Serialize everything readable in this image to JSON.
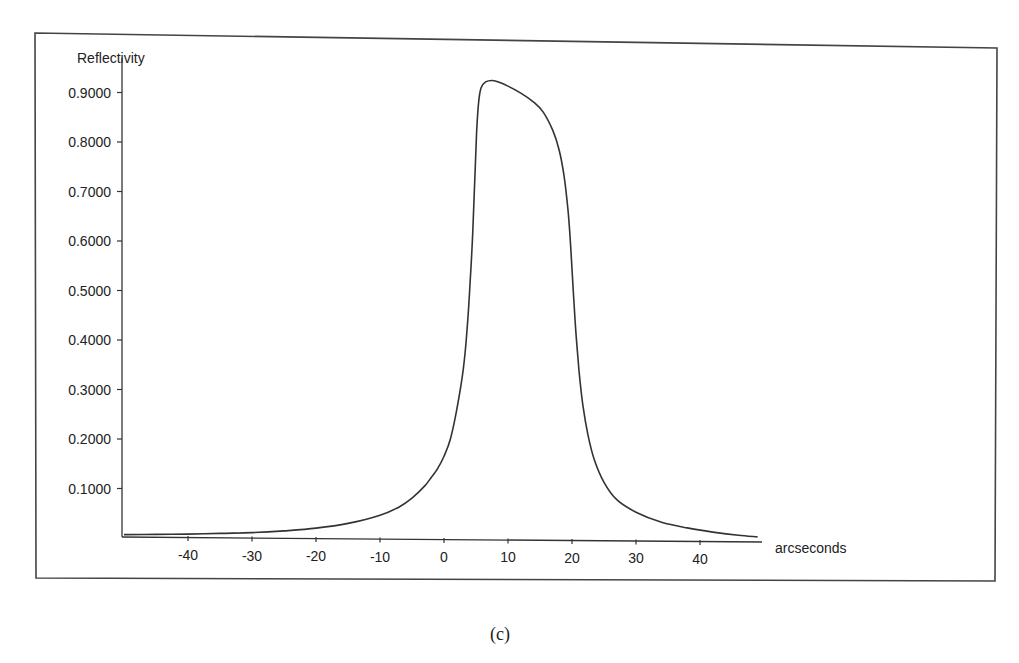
{
  "figure": {
    "caption": "(c)"
  },
  "chart_data": {
    "type": "line",
    "title": "",
    "xlabel": "arcseconds",
    "ylabel": "Reflectivity",
    "xlim": [
      -50,
      49
    ],
    "ylim": [
      0,
      0.95
    ],
    "grid": false,
    "legend": null,
    "x_ticks": [
      -40,
      -30,
      -20,
      -10,
      0,
      10,
      20,
      30,
      40
    ],
    "x_tick_labels": [
      "-40",
      "-30",
      "-20",
      "-10",
      "0",
      "10",
      "20",
      "30",
      "40"
    ],
    "y_ticks": [
      0.1,
      0.2,
      0.3,
      0.4,
      0.5,
      0.6,
      0.7,
      0.8,
      0.9
    ],
    "y_tick_labels": [
      "0.1000",
      "0.2000",
      "0.3000",
      "0.4000",
      "0.5000",
      "0.6000",
      "0.7000",
      "0.8000",
      "0.9000"
    ],
    "series": [
      {
        "name": "Reflectivity curve",
        "color": "#333333",
        "x": [
          -50,
          -45,
          -40,
          -35,
          -30,
          -25,
          -20,
          -15,
          -10,
          -7,
          -5,
          -3,
          -2,
          -1,
          0,
          1,
          2,
          3,
          3.6,
          4.1,
          4.5,
          4.8,
          5.1,
          5.4,
          5.8,
          6.5,
          7.5,
          8.5,
          10,
          12,
          14,
          15.5,
          17,
          18,
          18.8,
          19.4,
          19.8,
          20.2,
          20.6,
          21.1,
          21.7,
          22.5,
          23.5,
          25,
          27,
          30,
          34,
          38,
          42,
          46,
          49
        ],
        "y": [
          0.002,
          0.003,
          0.004,
          0.006,
          0.008,
          0.012,
          0.018,
          0.028,
          0.045,
          0.062,
          0.08,
          0.105,
          0.122,
          0.14,
          0.165,
          0.2,
          0.26,
          0.34,
          0.42,
          0.52,
          0.62,
          0.72,
          0.82,
          0.88,
          0.91,
          0.922,
          0.925,
          0.922,
          0.914,
          0.9,
          0.882,
          0.862,
          0.825,
          0.785,
          0.73,
          0.66,
          0.59,
          0.5,
          0.42,
          0.34,
          0.27,
          0.21,
          0.16,
          0.115,
          0.08,
          0.055,
          0.035,
          0.024,
          0.016,
          0.01,
          0.007
        ]
      }
    ],
    "annotations": []
  },
  "layout": {
    "frame_color": "#444444",
    "line_color": "#333333"
  }
}
